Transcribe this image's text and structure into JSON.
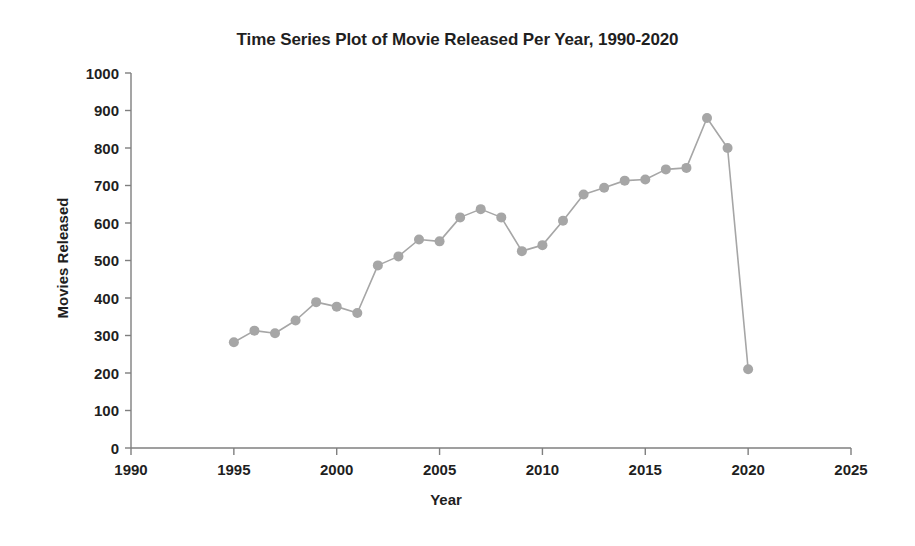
{
  "chart_data": {
    "type": "line",
    "title": "Time Series Plot of Movie Released Per Year, 1990-2020",
    "xlabel": "Year",
    "ylabel": "Movies Released",
    "xlim": [
      1990,
      2025
    ],
    "ylim": [
      0,
      1000
    ],
    "xticks": [
      1990,
      1995,
      2000,
      2005,
      2010,
      2015,
      2020,
      2025
    ],
    "yticks": [
      0,
      100,
      200,
      300,
      400,
      500,
      600,
      700,
      800,
      900,
      1000
    ],
    "grid": false,
    "legend": null,
    "series": [
      {
        "name": "Movies Released",
        "color": "#a6a6a6",
        "marker": "circle",
        "x": [
          1995,
          1996,
          1997,
          1998,
          1999,
          2000,
          2001,
          2002,
          2003,
          2004,
          2005,
          2006,
          2007,
          2008,
          2009,
          2010,
          2011,
          2012,
          2013,
          2014,
          2015,
          2016,
          2017,
          2018,
          2019,
          2020
        ],
        "values": [
          282,
          313,
          306,
          340,
          389,
          377,
          360,
          487,
          511,
          556,
          551,
          615,
          637,
          615,
          525,
          541,
          606,
          676,
          694,
          713,
          716,
          743,
          747,
          880,
          800,
          210
        ]
      }
    ]
  },
  "figure": {
    "title": "Time Series Plot of Movie Released Per Year, 1990-2020",
    "xlabel": "Year",
    "ylabel": "Movies Released",
    "background": "#ffffff",
    "accent": "#a6a6a6",
    "axis_color": "#7f7f7f"
  }
}
